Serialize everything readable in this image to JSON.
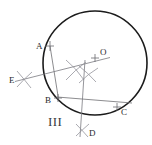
{
  "figure": {
    "numeral_label": "III",
    "caption": "",
    "type": "compass-and-straightedge circle centre construction",
    "colors": {
      "circle_stroke": "#1b1b1b",
      "construction_stroke": "#8e8e95",
      "chord_stroke": "#6e6e72",
      "label_text": "#2a2a2e",
      "background": "#ffffff"
    }
  },
  "canvas": {
    "width": 152,
    "height": 145
  },
  "circle": {
    "name": "main-circle",
    "cx": 95,
    "cy": 63,
    "r": 52
  },
  "points": [
    {
      "id": "A",
      "label": "A",
      "x": 50,
      "y": 46,
      "label_x": 36,
      "label_y": 48,
      "marked": true
    },
    {
      "id": "O",
      "label": "O",
      "x": 95,
      "y": 58,
      "label_x": 100,
      "label_y": 54,
      "marked": true
    },
    {
      "id": "E",
      "label": "E",
      "x": 24,
      "y": 79,
      "label_x": 10,
      "label_y": 82,
      "marked": true
    },
    {
      "id": "B",
      "label": "B",
      "x": 58,
      "y": 98,
      "label_x": 46,
      "label_y": 102,
      "marked": true
    },
    {
      "id": "C",
      "label": "C",
      "x": 117,
      "y": 108,
      "label_x": 121,
      "label_y": 114,
      "marked": true
    },
    {
      "id": "D",
      "label": "D",
      "x": 82,
      "y": 130,
      "label_x": 89,
      "label_y": 135,
      "marked": true
    }
  ],
  "segments": [
    {
      "id": "chord-AB",
      "from": "A",
      "to": "B",
      "x1": 50,
      "y1": 46,
      "x2": 58,
      "y2": 98
    },
    {
      "id": "chord-BC",
      "from": "B",
      "to": "C",
      "x1": 58,
      "y1": 98,
      "x2": 130,
      "y2": 104
    },
    {
      "id": "bisector-AB-through-E",
      "from": "E",
      "to": "O",
      "x1": 16,
      "y1": 81,
      "x2": 108,
      "y2": 58
    },
    {
      "id": "bisector-BC-through-D",
      "from": "O",
      "to": "D",
      "x1": 86,
      "y1": 62,
      "x2": 80,
      "y2": 136
    }
  ],
  "construction_arcs": [
    {
      "id": "arc-cross-upper",
      "cx": 76,
      "cy": 70,
      "note": "intersection of arcs from A and B"
    },
    {
      "id": "arc-cross-lower",
      "cx": 88,
      "cy": 74,
      "note": "intersection of arcs from B and C"
    },
    {
      "id": "arc-cross-E",
      "cx": 24,
      "cy": 79,
      "note": "arc intersection at E"
    },
    {
      "id": "arc-cross-D",
      "cx": 82,
      "cy": 130,
      "note": "arc intersection at D"
    }
  ]
}
